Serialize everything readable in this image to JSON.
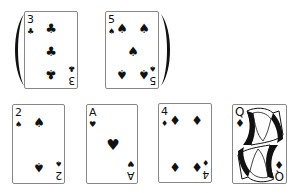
{
  "top_row": {
    "parentheses": {
      "open": "(",
      "close": ")"
    },
    "cards": [
      {
        "rank": "3",
        "suit": "clubs",
        "symbol": "♣"
      },
      {
        "rank": "5",
        "suit": "spades",
        "symbol": "♠"
      }
    ]
  },
  "bottom_row": {
    "cards": [
      {
        "rank": "2",
        "suit": "spades",
        "symbol": "♠"
      },
      {
        "rank": "A",
        "suit": "hearts",
        "symbol": "♥"
      },
      {
        "rank": "4",
        "suit": "diamonds",
        "symbol": "♦"
      },
      {
        "rank": "Q",
        "suit": "diamonds",
        "symbol": "♦"
      }
    ]
  },
  "colors": {
    "ink": "#111111",
    "card_border": "#888888",
    "background": "#ffffff"
  }
}
